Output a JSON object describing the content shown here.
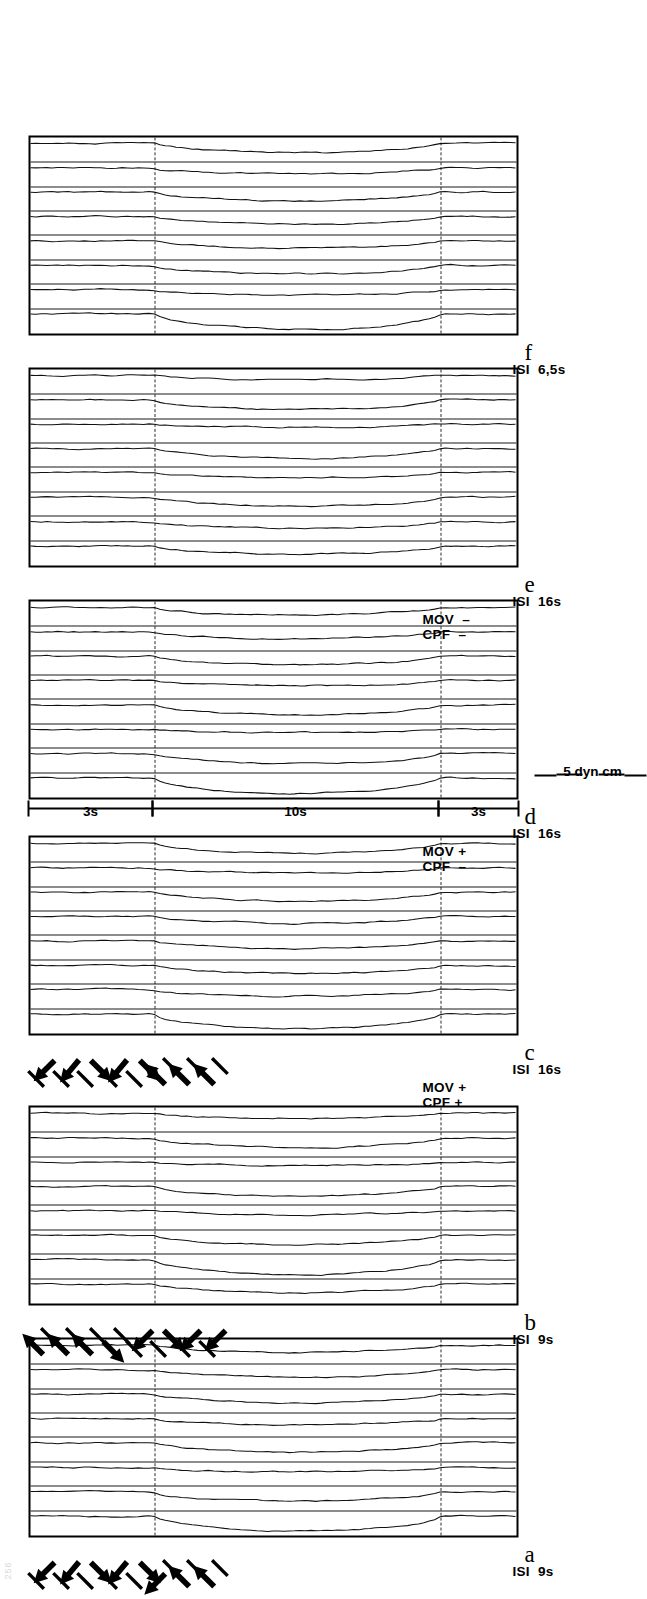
{
  "page": {
    "number": "256"
  },
  "figure": {
    "force_scale": {
      "label": "5 dyn cm",
      "value": 5,
      "unit": "dyn cm"
    },
    "time_marks": [
      {
        "label": "3s",
        "seconds": 3
      },
      {
        "label": "10s",
        "seconds": 10
      },
      {
        "label": "3s",
        "seconds": 3
      }
    ],
    "panels": [
      {
        "letter": "a",
        "isi_label": "ISI  9s",
        "isi_seconds": 9,
        "condition": "",
        "n_traces": 8,
        "arrows": [
          {
            "bar": 45,
            "force": 135
          },
          {
            "bar": 45,
            "force": 140
          },
          {
            "bar": 45,
            "force": 225
          },
          {
            "bar": 45,
            "force": 140
          },
          {
            "bar": 45,
            "force": 225
          },
          {
            "bar": 225,
            "force": 135
          },
          {
            "bar": 225,
            "force": 45
          },
          {
            "bar": 225,
            "force": 45
          }
        ]
      },
      {
        "letter": "b",
        "isi_label": "ISI  9s",
        "isi_seconds": 9,
        "condition": "",
        "n_traces": 8,
        "arrows": [
          {
            "bar": 225,
            "force": 45
          },
          {
            "bar": 225,
            "force": 45
          },
          {
            "bar": 225,
            "force": 45
          },
          {
            "bar": 225,
            "force": 225
          },
          {
            "bar": 45,
            "force": 135
          },
          {
            "bar": 45,
            "force": 225
          },
          {
            "bar": 45,
            "force": 135
          },
          {
            "bar": 45,
            "force": 135
          }
        ]
      },
      {
        "letter": "c",
        "isi_label": "ISI  16s",
        "isi_seconds": 16,
        "condition": "MOV +\nCPF +",
        "n_traces": 8,
        "arrows": [
          {
            "bar": 45,
            "force": 135
          },
          {
            "bar": 45,
            "force": 140
          },
          {
            "bar": 45,
            "force": 225
          },
          {
            "bar": 45,
            "force": 140
          },
          {
            "bar": 45,
            "force": 225
          },
          {
            "bar": 225,
            "force": 45
          },
          {
            "bar": 225,
            "force": 45
          },
          {
            "bar": 225,
            "force": 45
          }
        ]
      },
      {
        "letter": "d",
        "isi_label": "ISI  16s",
        "isi_seconds": 16,
        "condition": "MOV +\nCPF  –",
        "n_traces": 8,
        "arrows": []
      },
      {
        "letter": "e",
        "isi_label": "ISI  16s",
        "isi_seconds": 16,
        "condition": "MOV  –\nCPF  –",
        "n_traces": 8,
        "arrows": []
      },
      {
        "letter": "f",
        "isi_label": "ISI  6,5s",
        "isi_seconds": 6.5,
        "condition": "",
        "n_traces": 8,
        "arrows": []
      }
    ]
  },
  "chart_data": {
    "type": "line",
    "title": "",
    "xlabel": "time",
    "ylabel": "force (dyn cm)",
    "grid": false,
    "legend": "none",
    "axis_segments_s": [
      3,
      10,
      3
    ],
    "force_calibration_dyn_cm": 5,
    "panel_series": [
      {
        "panel": "a",
        "isi_s": 9,
        "condition": "",
        "n_traces": 8
      },
      {
        "panel": "b",
        "isi_s": 9,
        "condition": "",
        "n_traces": 8
      },
      {
        "panel": "c",
        "isi_s": 16,
        "condition": "MOV + CPF +",
        "n_traces": 8
      },
      {
        "panel": "d",
        "isi_s": 16,
        "condition": "MOV + CPF -",
        "n_traces": 8
      },
      {
        "panel": "e",
        "isi_s": 16,
        "condition": "MOV - CPF -",
        "n_traces": 8
      },
      {
        "panel": "f",
        "isi_s": 6.5,
        "condition": "",
        "n_traces": 8
      }
    ]
  }
}
